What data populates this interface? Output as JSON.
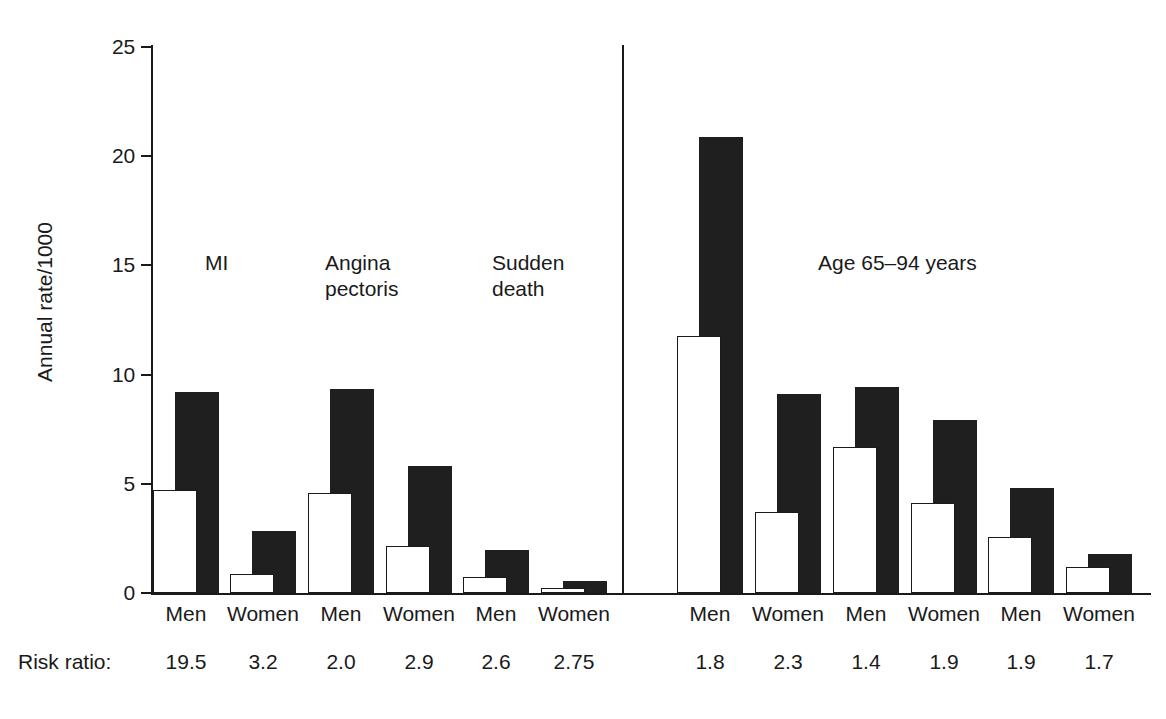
{
  "chart_data": {
    "type": "bar",
    "title": "",
    "xlabel": "",
    "ylabel": "Annual rate/1000",
    "ylim": [
      0,
      25
    ],
    "yticks": [
      "0",
      "5",
      "10",
      "15",
      "20",
      "25"
    ],
    "ytick_values": [
      0,
      5,
      10,
      15,
      20,
      25
    ],
    "grid": false,
    "legend_position": "none",
    "categories": [
      "Men",
      "Women",
      "Men",
      "Women",
      "Men",
      "Women",
      "Men",
      "Women",
      "Men",
      "Women",
      "Men",
      "Women"
    ],
    "series": [
      {
        "name": "white-bar",
        "values": [
          4.7,
          0.85,
          4.6,
          2.15,
          0.75,
          0.25,
          11.75,
          3.7,
          6.7,
          4.1,
          2.55,
          1.2
        ]
      },
      {
        "name": "black-bar",
        "values": [
          9.2,
          2.85,
          9.35,
          5.8,
          1.95,
          0.55,
          20.9,
          9.1,
          9.45,
          7.9,
          4.8,
          1.8
        ]
      }
    ],
    "annotations": [
      {
        "text": "MI",
        "x": 0.19,
        "y": 14.4
      },
      {
        "text": "Angina\npectoris",
        "x": 0.33,
        "y": 14.4
      },
      {
        "text": "Sudden\ndeath",
        "x": 0.45,
        "y": 14.4
      },
      {
        "text": "Age 65–94 years",
        "x": 0.74,
        "y": 14.4
      }
    ],
    "risk_ratio_row_label": "Risk ratio:",
    "risk_ratios": [
      "19.5",
      "3.2",
      "2.0",
      "2.9",
      "2.6",
      "2.75",
      "1.8",
      "2.3",
      "1.4",
      "1.9",
      "1.9",
      "1.7"
    ]
  },
  "axis": {
    "y_title": "Annual rate/1000",
    "ticks": [
      {
        "label": "25",
        "value": 25
      },
      {
        "label": "20",
        "value": 20
      },
      {
        "label": "15",
        "value": 15
      },
      {
        "label": "10",
        "value": 10
      },
      {
        "label": "5",
        "value": 5
      },
      {
        "label": "0",
        "value": 0
      }
    ]
  },
  "annotations": {
    "mi": "MI",
    "angina": "Angina\npectoris",
    "sudden": "Sudden\ndeath",
    "age": "Age 65–94 years"
  },
  "risk_ratio": {
    "label": "Risk ratio:",
    "values": [
      "19.5",
      "3.2",
      "2.0",
      "2.9",
      "2.6",
      "2.75",
      "1.8",
      "2.3",
      "1.4",
      "1.9",
      "1.9",
      "1.7"
    ]
  },
  "groups": [
    {
      "label": "Men",
      "white": 4.7,
      "black": 9.2,
      "rr": "19.5",
      "center": 186
    },
    {
      "label": "Women",
      "white": 0.85,
      "black": 2.85,
      "rr": "3.2",
      "center": 263
    },
    {
      "label": "Men",
      "white": 4.6,
      "black": 9.35,
      "rr": "2.0",
      "center": 341
    },
    {
      "label": "Women",
      "white": 2.15,
      "black": 5.8,
      "rr": "2.9",
      "center": 419
    },
    {
      "label": "Men",
      "white": 0.75,
      "black": 1.95,
      "rr": "2.6",
      "center": 496
    },
    {
      "label": "Women",
      "white": 0.25,
      "black": 0.55,
      "rr": "2.75",
      "center": 574
    },
    {
      "label": "Men",
      "white": 11.75,
      "black": 20.9,
      "rr": "1.8",
      "center": 710
    },
    {
      "label": "Women",
      "white": 3.7,
      "black": 9.1,
      "rr": "2.3",
      "center": 788
    },
    {
      "label": "Men",
      "white": 6.7,
      "black": 9.45,
      "rr": "1.4",
      "center": 866
    },
    {
      "label": "Women",
      "white": 4.1,
      "black": 7.9,
      "rr": "1.9",
      "center": 944
    },
    {
      "label": "Men",
      "white": 2.55,
      "black": 4.8,
      "rr": "1.9",
      "center": 1021
    },
    {
      "label": "Women",
      "white": 1.2,
      "black": 1.8,
      "rr": "1.7",
      "center": 1099
    }
  ]
}
